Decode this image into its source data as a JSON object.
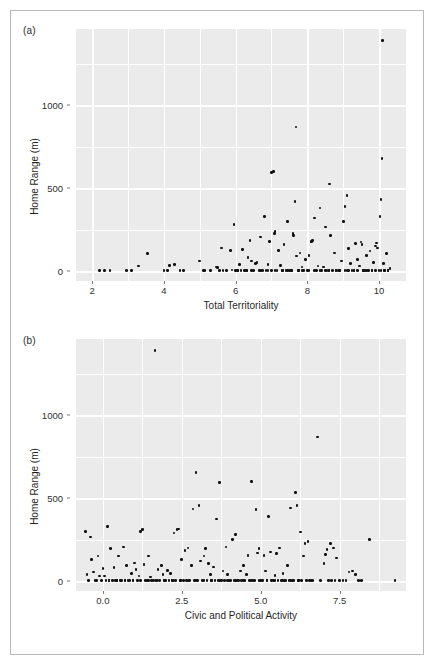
{
  "figure": {
    "background": "#ffffff",
    "panel_background": "#ebebeb",
    "gridline_color": "#ffffff",
    "point_color": "#111111",
    "border_color": "#b9b9b9"
  },
  "chart_data": [
    {
      "type": "scatter",
      "panel_label": "(a)",
      "title": "",
      "xlabel": "Total Territoriality",
      "ylabel": "Home Range (m)",
      "xlim": [
        1.55,
        10.75
      ],
      "ylim": [
        -60,
        1460
      ],
      "xticks": [
        2,
        4,
        6,
        8,
        10
      ],
      "xtick_labels": [
        "2",
        "4",
        "6",
        "8",
        "10"
      ],
      "yticks": [
        0,
        500,
        1000
      ],
      "ytick_labels": [
        "0",
        "500",
        "1000"
      ],
      "y_minor_gridlines": [
        250,
        750,
        1250
      ],
      "x_minor_gridlines": [
        3,
        5,
        7,
        9
      ],
      "grid": true,
      "legend": "none",
      "points": [
        [
          2.2,
          2
        ],
        [
          2.35,
          2
        ],
        [
          2.5,
          3
        ],
        [
          2.95,
          2
        ],
        [
          3.1,
          2
        ],
        [
          3.3,
          30
        ],
        [
          3.55,
          105
        ],
        [
          4.0,
          2
        ],
        [
          4.1,
          2
        ],
        [
          4.15,
          35
        ],
        [
          4.3,
          40
        ],
        [
          4.45,
          3
        ],
        [
          4.55,
          3
        ],
        [
          5.0,
          60
        ],
        [
          5.1,
          3
        ],
        [
          5.15,
          3
        ],
        [
          5.3,
          3
        ],
        [
          5.45,
          25
        ],
        [
          5.5,
          22
        ],
        [
          5.55,
          3
        ],
        [
          5.6,
          140
        ],
        [
          5.65,
          3
        ],
        [
          5.75,
          3
        ],
        [
          5.85,
          125
        ],
        [
          5.9,
          6
        ],
        [
          5.95,
          280
        ],
        [
          6.0,
          3
        ],
        [
          6.05,
          5
        ],
        [
          6.1,
          40
        ],
        [
          6.15,
          3
        ],
        [
          6.2,
          130
        ],
        [
          6.25,
          3
        ],
        [
          6.3,
          3
        ],
        [
          6.35,
          80
        ],
        [
          6.4,
          185
        ],
        [
          6.45,
          60
        ],
        [
          6.5,
          3
        ],
        [
          6.55,
          45
        ],
        [
          6.6,
          50
        ],
        [
          6.65,
          3
        ],
        [
          6.7,
          205
        ],
        [
          6.75,
          3
        ],
        [
          6.8,
          330
        ],
        [
          6.85,
          5
        ],
        [
          6.9,
          40
        ],
        [
          6.95,
          180
        ],
        [
          7.0,
          595
        ],
        [
          7.05,
          600
        ],
        [
          7.08,
          225
        ],
        [
          7.1,
          240
        ],
        [
          7.15,
          3
        ],
        [
          7.2,
          125
        ],
        [
          7.25,
          35
        ],
        [
          7.3,
          3
        ],
        [
          7.35,
          160
        ],
        [
          7.4,
          3
        ],
        [
          7.45,
          300
        ],
        [
          7.5,
          3
        ],
        [
          7.55,
          5
        ],
        [
          7.6,
          225
        ],
        [
          7.62,
          215
        ],
        [
          7.65,
          420
        ],
        [
          7.68,
          870
        ],
        [
          7.7,
          90
        ],
        [
          7.75,
          3
        ],
        [
          7.8,
          110
        ],
        [
          7.85,
          25
        ],
        [
          7.9,
          3
        ],
        [
          7.95,
          70
        ],
        [
          8.0,
          3
        ],
        [
          8.05,
          95
        ],
        [
          8.1,
          180
        ],
        [
          8.12,
          175
        ],
        [
          8.15,
          185
        ],
        [
          8.2,
          320
        ],
        [
          8.25,
          3
        ],
        [
          8.3,
          30
        ],
        [
          8.35,
          380
        ],
        [
          8.4,
          3
        ],
        [
          8.45,
          25
        ],
        [
          8.5,
          265
        ],
        [
          8.55,
          3
        ],
        [
          8.6,
          3
        ],
        [
          8.62,
          525
        ],
        [
          8.65,
          215
        ],
        [
          8.7,
          3
        ],
        [
          8.75,
          110
        ],
        [
          8.8,
          3
        ],
        [
          8.85,
          5
        ],
        [
          8.9,
          3
        ],
        [
          8.95,
          60
        ],
        [
          9.0,
          300
        ],
        [
          9.05,
          390
        ],
        [
          9.1,
          455
        ],
        [
          9.12,
          3
        ],
        [
          9.15,
          135
        ],
        [
          9.2,
          45
        ],
        [
          9.25,
          3
        ],
        [
          9.3,
          3
        ],
        [
          9.35,
          165
        ],
        [
          9.4,
          70
        ],
        [
          9.45,
          30
        ],
        [
          9.5,
          175
        ],
        [
          9.52,
          160
        ],
        [
          9.55,
          3
        ],
        [
          9.6,
          3
        ],
        [
          9.65,
          95
        ],
        [
          9.7,
          5
        ],
        [
          9.75,
          120
        ],
        [
          9.8,
          3
        ],
        [
          9.85,
          50
        ],
        [
          9.9,
          150
        ],
        [
          9.92,
          170
        ],
        [
          9.95,
          140
        ],
        [
          10.0,
          3
        ],
        [
          10.02,
          330
        ],
        [
          10.05,
          430
        ],
        [
          10.08,
          680
        ],
        [
          10.1,
          1390
        ],
        [
          10.12,
          45
        ],
        [
          10.15,
          3
        ],
        [
          10.2,
          105
        ],
        [
          10.25,
          3
        ],
        [
          10.3,
          15
        ],
        [
          6.05,
          3
        ],
        [
          6.45,
          3
        ],
        [
          7.0,
          3
        ],
        [
          7.3,
          5
        ],
        [
          7.55,
          3
        ],
        [
          7.85,
          3
        ],
        [
          8.05,
          3
        ],
        [
          8.35,
          3
        ],
        [
          8.6,
          3
        ],
        [
          8.9,
          3
        ],
        [
          9.15,
          3
        ],
        [
          9.4,
          3
        ],
        [
          9.65,
          3
        ],
        [
          9.9,
          3
        ],
        [
          10.15,
          3
        ],
        [
          6.7,
          3
        ],
        [
          7.1,
          3
        ],
        [
          7.45,
          3
        ],
        [
          7.75,
          3
        ],
        [
          8.2,
          3
        ],
        [
          8.5,
          3
        ],
        [
          8.8,
          3
        ],
        [
          9.05,
          3
        ],
        [
          9.3,
          3
        ],
        [
          9.55,
          3
        ],
        [
          9.8,
          3
        ],
        [
          10.05,
          3
        ],
        [
          10.25,
          3
        ],
        [
          6.9,
          3
        ],
        [
          6.3,
          3
        ]
      ]
    },
    {
      "type": "scatter",
      "panel_label": "(b)",
      "title": "",
      "xlabel": "Civic and Political Activity",
      "ylabel": "Home Range (m)",
      "xlim": [
        -0.85,
        9.6
      ],
      "ylim": [
        -60,
        1460
      ],
      "xticks": [
        0.0,
        2.5,
        5.0,
        7.5
      ],
      "xtick_labels": [
        "0.0",
        "2.5",
        "5.0",
        "7.5"
      ],
      "yticks": [
        0,
        500,
        1000
      ],
      "ytick_labels": [
        "0",
        "500",
        "1000"
      ],
      "y_minor_gridlines": [
        250,
        750,
        1250
      ],
      "x_minor_gridlines": [
        -1.25,
        1.25,
        3.75,
        6.25,
        8.75
      ],
      "grid": true,
      "legend": "none",
      "points": [
        [
          -0.55,
          300
        ],
        [
          -0.5,
          40
        ],
        [
          -0.45,
          5
        ],
        [
          -0.4,
          265
        ],
        [
          -0.35,
          130
        ],
        [
          -0.3,
          55
        ],
        [
          -0.25,
          3
        ],
        [
          -0.2,
          5
        ],
        [
          -0.15,
          150
        ],
        [
          -0.1,
          30
        ],
        [
          -0.05,
          3
        ],
        [
          0.0,
          75
        ],
        [
          0.05,
          30
        ],
        [
          0.1,
          5
        ],
        [
          0.15,
          330
        ],
        [
          0.2,
          3
        ],
        [
          0.25,
          195
        ],
        [
          0.3,
          3
        ],
        [
          0.35,
          80
        ],
        [
          0.4,
          3
        ],
        [
          0.45,
          3
        ],
        [
          0.5,
          150
        ],
        [
          0.55,
          3
        ],
        [
          0.6,
          3
        ],
        [
          0.65,
          205
        ],
        [
          0.7,
          3
        ],
        [
          0.75,
          95
        ],
        [
          0.8,
          3
        ],
        [
          0.85,
          5
        ],
        [
          0.9,
          45
        ],
        [
          0.95,
          3
        ],
        [
          1.0,
          110
        ],
        [
          1.05,
          70
        ],
        [
          1.1,
          3
        ],
        [
          1.15,
          30
        ],
        [
          1.2,
          300
        ],
        [
          1.25,
          310
        ],
        [
          1.3,
          100
        ],
        [
          1.35,
          3
        ],
        [
          1.4,
          3
        ],
        [
          1.45,
          150
        ],
        [
          1.5,
          25
        ],
        [
          1.55,
          3
        ],
        [
          1.6,
          3
        ],
        [
          1.65,
          1390
        ],
        [
          1.7,
          3
        ],
        [
          1.75,
          70
        ],
        [
          1.8,
          3
        ],
        [
          1.85,
          95
        ],
        [
          1.9,
          40
        ],
        [
          1.95,
          3
        ],
        [
          2.0,
          3
        ],
        [
          2.05,
          65
        ],
        [
          2.1,
          3
        ],
        [
          2.15,
          45
        ],
        [
          2.2,
          3
        ],
        [
          2.25,
          290
        ],
        [
          2.3,
          5
        ],
        [
          2.35,
          310
        ],
        [
          2.4,
          315
        ],
        [
          2.45,
          3
        ],
        [
          2.5,
          130
        ],
        [
          2.55,
          3
        ],
        [
          2.6,
          185
        ],
        [
          2.65,
          3
        ],
        [
          2.7,
          200
        ],
        [
          2.75,
          3
        ],
        [
          2.8,
          95
        ],
        [
          2.85,
          435
        ],
        [
          2.9,
          5
        ],
        [
          2.95,
          655
        ],
        [
          3.0,
          3
        ],
        [
          3.05,
          455
        ],
        [
          3.1,
          120
        ],
        [
          3.15,
          3
        ],
        [
          3.2,
          150
        ],
        [
          3.25,
          195
        ],
        [
          3.3,
          3
        ],
        [
          3.35,
          105
        ],
        [
          3.4,
          40
        ],
        [
          3.45,
          3
        ],
        [
          3.5,
          85
        ],
        [
          3.55,
          3
        ],
        [
          3.6,
          375
        ],
        [
          3.65,
          3
        ],
        [
          3.7,
          595
        ],
        [
          3.75,
          3
        ],
        [
          3.8,
          60
        ],
        [
          3.85,
          3
        ],
        [
          3.9,
          205
        ],
        [
          3.95,
          40
        ],
        [
          4.0,
          3
        ],
        [
          4.05,
          3
        ],
        [
          4.1,
          250
        ],
        [
          4.15,
          3
        ],
        [
          4.2,
          280
        ],
        [
          4.25,
          5
        ],
        [
          4.3,
          3
        ],
        [
          4.35,
          60
        ],
        [
          4.4,
          3
        ],
        [
          4.45,
          95
        ],
        [
          4.5,
          3
        ],
        [
          4.55,
          40
        ],
        [
          4.6,
          155
        ],
        [
          4.65,
          3
        ],
        [
          4.7,
          600
        ],
        [
          4.75,
          3
        ],
        [
          4.8,
          3
        ],
        [
          4.85,
          430
        ],
        [
          4.9,
          170
        ],
        [
          4.95,
          195
        ],
        [
          5.0,
          3
        ],
        [
          5.05,
          3
        ],
        [
          5.1,
          155
        ],
        [
          5.15,
          60
        ],
        [
          5.2,
          3
        ],
        [
          5.25,
          390
        ],
        [
          5.3,
          175
        ],
        [
          5.35,
          3
        ],
        [
          5.4,
          3
        ],
        [
          5.45,
          35
        ],
        [
          5.5,
          165
        ],
        [
          5.55,
          3
        ],
        [
          5.6,
          200
        ],
        [
          5.65,
          3
        ],
        [
          5.7,
          45
        ],
        [
          5.75,
          3
        ],
        [
          5.8,
          3
        ],
        [
          5.85,
          95
        ],
        [
          5.9,
          3
        ],
        [
          5.95,
          440
        ],
        [
          6.0,
          3
        ],
        [
          6.05,
          3
        ],
        [
          6.1,
          535
        ],
        [
          6.15,
          455
        ],
        [
          6.2,
          3
        ],
        [
          6.25,
          295
        ],
        [
          6.3,
          3
        ],
        [
          6.35,
          150
        ],
        [
          6.4,
          225
        ],
        [
          6.45,
          3
        ],
        [
          6.5,
          240
        ],
        [
          6.55,
          3
        ],
        [
          6.6,
          3
        ],
        [
          6.65,
          3
        ],
        [
          6.8,
          870
        ],
        [
          6.9,
          3
        ],
        [
          7.0,
          105
        ],
        [
          7.05,
          160
        ],
        [
          7.1,
          190
        ],
        [
          7.15,
          3
        ],
        [
          7.2,
          225
        ],
        [
          7.25,
          3
        ],
        [
          7.3,
          200
        ],
        [
          7.35,
          3
        ],
        [
          7.4,
          140
        ],
        [
          7.5,
          3
        ],
        [
          7.6,
          3
        ],
        [
          7.7,
          5
        ],
        [
          7.8,
          55
        ],
        [
          7.9,
          60
        ],
        [
          8.0,
          40
        ],
        [
          8.1,
          3
        ],
        [
          8.2,
          3
        ],
        [
          8.45,
          250
        ],
        [
          9.25,
          3
        ],
        [
          0.2,
          3
        ],
        [
          0.45,
          3
        ],
        [
          0.7,
          3
        ],
        [
          0.95,
          3
        ],
        [
          1.2,
          3
        ],
        [
          1.45,
          3
        ],
        [
          1.7,
          3
        ],
        [
          1.95,
          3
        ],
        [
          2.2,
          3
        ],
        [
          2.45,
          3
        ],
        [
          2.7,
          3
        ],
        [
          2.95,
          3
        ],
        [
          3.2,
          3
        ],
        [
          3.45,
          3
        ],
        [
          3.7,
          3
        ],
        [
          3.95,
          3
        ],
        [
          4.2,
          3
        ],
        [
          4.45,
          3
        ],
        [
          4.7,
          3
        ],
        [
          4.95,
          3
        ],
        [
          5.2,
          3
        ],
        [
          5.45,
          3
        ],
        [
          5.7,
          3
        ],
        [
          5.95,
          3
        ],
        [
          6.2,
          3
        ]
      ]
    }
  ]
}
